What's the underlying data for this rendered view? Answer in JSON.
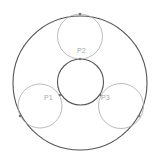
{
  "diagram": {
    "outer_circle": {
      "cx": 80,
      "cy": 83,
      "r": 67,
      "stroke": "#555555"
    },
    "inner_circle": {
      "cx": 80.5,
      "cy": 82,
      "r": 23,
      "stroke": "#555555"
    },
    "small_circles": [
      {
        "label": "P1",
        "cx": 40,
        "cy": 106,
        "r": 22,
        "stroke": "#aaaaaa",
        "label_x": 44,
        "label_y": 100
      },
      {
        "label": "P2",
        "cx": 80,
        "cy": 36.5,
        "r": 22.5,
        "stroke": "#aaaaaa",
        "label_x": 77,
        "label_y": 53
      },
      {
        "label": "P3",
        "cx": 121,
        "cy": 106,
        "r": 22.5,
        "stroke": "#aaaaaa",
        "label_x": 101,
        "label_y": 100
      }
    ],
    "tangent_points": [
      {
        "x": 80,
        "y": 14
      },
      {
        "x": 80,
        "y": 59
      },
      {
        "x": 60,
        "y": 95
      },
      {
        "x": 100,
        "y": 95
      },
      {
        "x": 20,
        "y": 116
      },
      {
        "x": 139,
        "y": 116
      }
    ],
    "point_color": "#777777"
  }
}
